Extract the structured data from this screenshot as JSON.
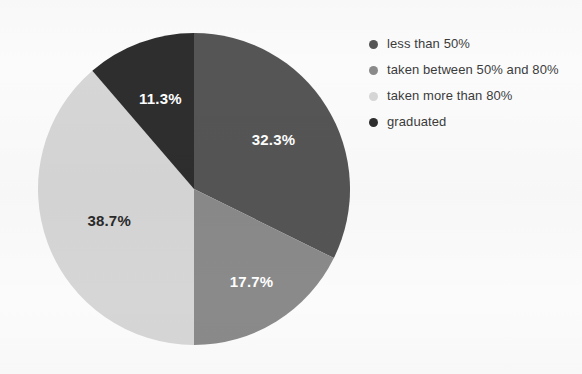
{
  "chart_data": {
    "type": "pie",
    "title": "",
    "xlabel": "",
    "ylabel": "",
    "categories": [
      "less than 50%",
      "taken between 50% and 80%",
      "taken more than 80%",
      "graduated"
    ],
    "values": [
      32.3,
      17.7,
      38.7,
      11.3
    ],
    "value_labels": [
      "32.3%",
      "17.7%",
      "38.7%",
      "11.3%"
    ],
    "colors": [
      "#555555",
      "#8a8a8a",
      "#d6d6d6",
      "#2e2e2e"
    ],
    "label_text_colors": [
      "#ffffff",
      "#ffffff",
      "#2a2a2a",
      "#ffffff"
    ],
    "units": "percent",
    "start_angle_deg": 0,
    "direction": "clockwise",
    "legend_position": "right",
    "grid": false,
    "background": "#fbfbfb",
    "slices": [
      {
        "name": "less than 50%",
        "value": 32.3,
        "label": "32.3%",
        "color": "#555555",
        "label_color": "#ffffff",
        "start_deg": 0.0,
        "end_deg": 116.28
      },
      {
        "name": "taken between 50% and 80%",
        "value": 17.7,
        "label": "17.7%",
        "color": "#8a8a8a",
        "label_color": "#ffffff",
        "start_deg": 116.28,
        "end_deg": 180.0
      },
      {
        "name": "taken more than 80%",
        "value": 38.7,
        "label": "38.7%",
        "color": "#d6d6d6",
        "label_color": "#2a2a2a",
        "start_deg": 180.0,
        "end_deg": 319.32
      },
      {
        "name": "graduated",
        "value": 11.3,
        "label": "11.3%",
        "color": "#2e2e2e",
        "label_color": "#ffffff",
        "start_deg": 319.32,
        "end_deg": 360.0
      }
    ]
  },
  "legend": {
    "items": [
      {
        "label": "less than 50%",
        "color": "#555555"
      },
      {
        "label": "taken between 50% and 80%",
        "color": "#8a8a8a"
      },
      {
        "label": "taken more than 80%",
        "color": "#d6d6d6"
      },
      {
        "label": "graduated",
        "color": "#2e2e2e"
      }
    ]
  }
}
